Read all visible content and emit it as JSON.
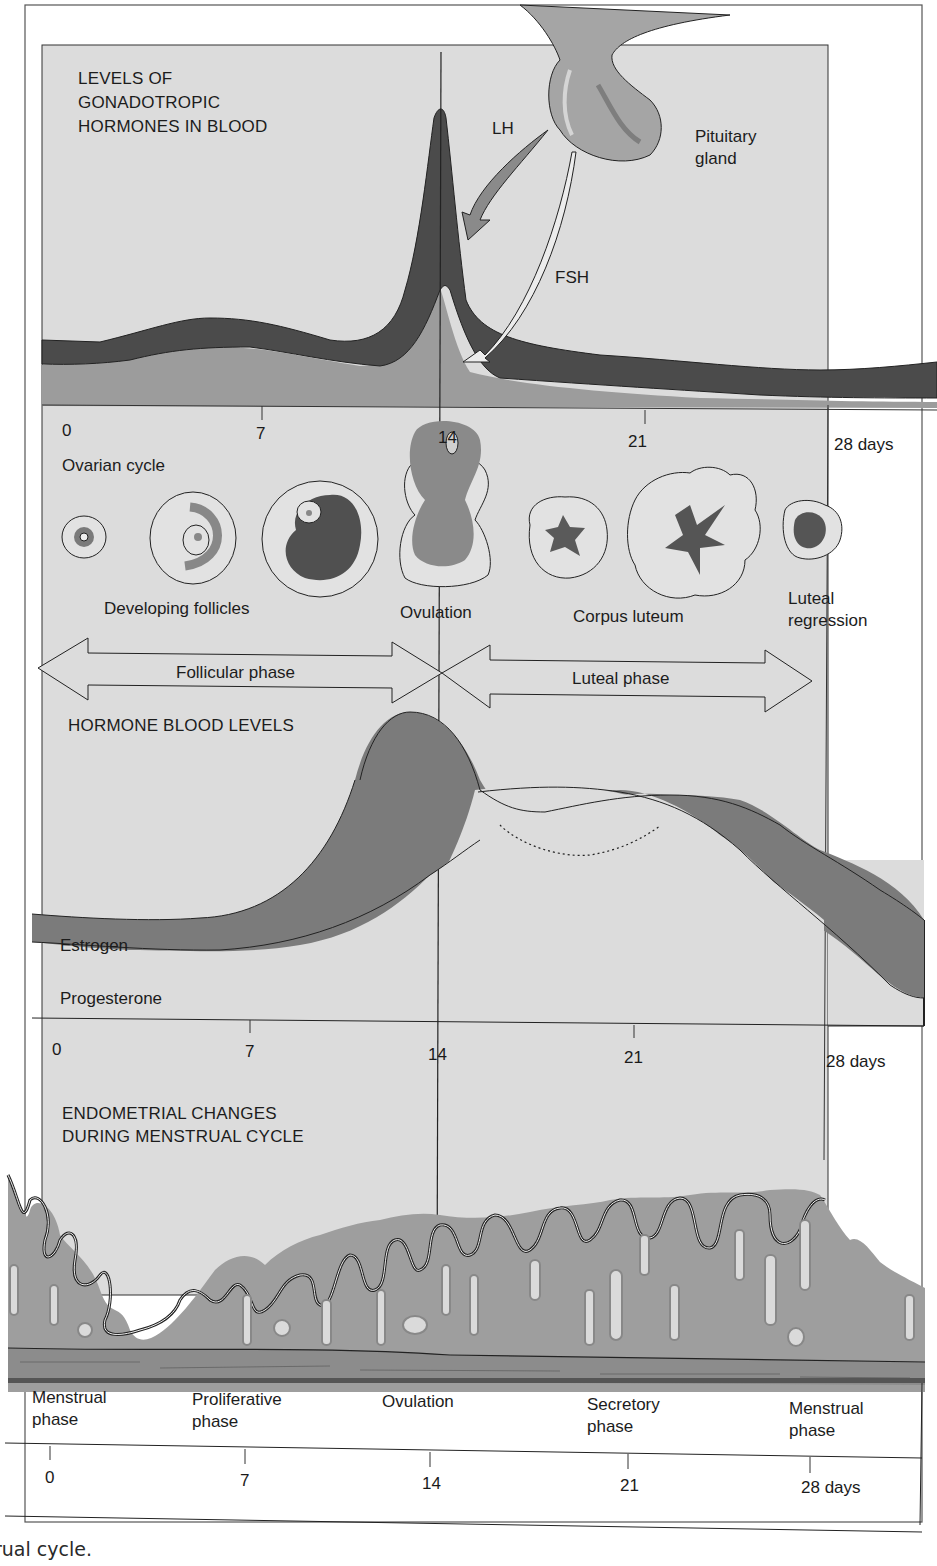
{
  "panels": {
    "gonadotropic": {
      "title_line1": "LEVELS OF",
      "title_line2": "GONADOTROPIC",
      "title_line3": "HORMONES IN BLOOD",
      "lh_label": "LH",
      "fsh_label": "FSH",
      "pituitary_line1": "Pituitary",
      "pituitary_line2": "gland"
    },
    "ovarian": {
      "axis_ticks": [
        "0",
        "7",
        "14",
        "21",
        "28 days"
      ],
      "title": "Ovarian cycle",
      "developing_follicles": "Developing follicles",
      "ovulation": "Ovulation",
      "corpus_luteum": "Corpus luteum",
      "luteal_regression_line1": "Luteal",
      "luteal_regression_line2": "regression",
      "follicular_phase": "Follicular phase",
      "luteal_phase": "Luteal phase"
    },
    "hormone_levels": {
      "title": "HORMONE BLOOD LEVELS",
      "estrogen": "Estrogen",
      "progesterone": "Progesterone",
      "axis_ticks": [
        "0",
        "7",
        "14",
        "21",
        "28 days"
      ]
    },
    "endometrial": {
      "title_line1": "ENDOMETRIAL CHANGES",
      "title_line2": "DURING MENSTRUAL CYCLE",
      "phases": [
        {
          "line1": "Menstrual",
          "line2": "phase"
        },
        {
          "line1": "Proliferative",
          "line2": "phase"
        },
        {
          "line1": "Ovulation",
          "line2": ""
        },
        {
          "line1": "Secretory",
          "line2": "phase"
        },
        {
          "line1": "Menstrual",
          "line2": "phase"
        }
      ],
      "axis_ticks": [
        "0",
        "7",
        "14",
        "21",
        "28 days"
      ]
    }
  },
  "caption_fragment": "rual cycle.",
  "colors": {
    "panel_bg": "#dcdcdc",
    "dark_band": "#4a4a4a",
    "mid_gray": "#9a9a9a",
    "estrogen_band": "#7c7c7c",
    "endometrium": "#9c9c9c",
    "page_bg": "#ffffff"
  }
}
